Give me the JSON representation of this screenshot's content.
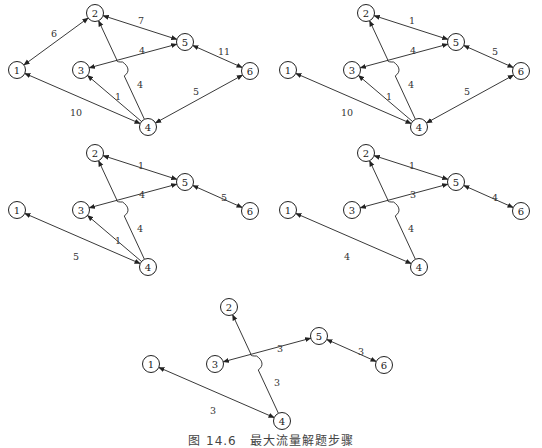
{
  "caption": "图 14.6　最大流量解题步骤",
  "node_layout": {
    "1": [
      17,
      70
    ],
    "2": [
      95,
      13
    ],
    "3": [
      81,
      70
    ],
    "4": [
      148,
      127
    ],
    "5": [
      185,
      42
    ],
    "6": [
      250,
      71
    ]
  },
  "panels": [
    {
      "id": "step-1",
      "offset": [
        0,
        0
      ],
      "nodes": [
        "1",
        "2",
        "3",
        "4",
        "5",
        "6"
      ],
      "edges": [
        {
          "from": "1",
          "to": "2",
          "weight": "6",
          "label_pos": [
            54,
            33
          ],
          "arrows": "both"
        },
        {
          "from": "2",
          "to": "5",
          "weight": "7",
          "label_pos": [
            141,
            20
          ],
          "arrows": "both"
        },
        {
          "from": "3",
          "to": "5",
          "weight": "4",
          "label_pos": [
            142,
            50
          ],
          "arrows": "both"
        },
        {
          "from": "5",
          "to": "6",
          "weight": "11",
          "label_pos": [
            224,
            51
          ],
          "arrows": "both"
        },
        {
          "from": "1",
          "to": "4",
          "weight": "10",
          "label_pos": [
            76,
            112
          ],
          "arrows": "both"
        },
        {
          "from": "4",
          "to": "3",
          "weight": "1",
          "label_pos": [
            118,
            96
          ],
          "arrows": "to"
        },
        {
          "from": "4",
          "to": "2",
          "weight": "4",
          "label_pos": [
            140,
            84
          ],
          "arrows": "to",
          "curved": true
        },
        {
          "from": "4",
          "to": "6",
          "weight": "5",
          "label_pos": [
            196,
            91
          ],
          "arrows": "both"
        }
      ]
    },
    {
      "id": "step-2",
      "offset": [
        271,
        0
      ],
      "nodes": [
        "1",
        "2",
        "3",
        "4",
        "5",
        "6"
      ],
      "edges": [
        {
          "from": "2",
          "to": "5",
          "weight": "1",
          "label_pos": [
            141,
            20
          ],
          "arrows": "both"
        },
        {
          "from": "3",
          "to": "5",
          "weight": "4",
          "label_pos": [
            142,
            50
          ],
          "arrows": "both"
        },
        {
          "from": "5",
          "to": "6",
          "weight": "5",
          "label_pos": [
            224,
            51
          ],
          "arrows": "both"
        },
        {
          "from": "1",
          "to": "4",
          "weight": "10",
          "label_pos": [
            76,
            112
          ],
          "arrows": "both"
        },
        {
          "from": "4",
          "to": "3",
          "weight": "1",
          "label_pos": [
            118,
            96
          ],
          "arrows": "to"
        },
        {
          "from": "4",
          "to": "2",
          "weight": "4",
          "label_pos": [
            140,
            84
          ],
          "arrows": "to",
          "curved": true
        },
        {
          "from": "4",
          "to": "6",
          "weight": "5",
          "label_pos": [
            196,
            91
          ],
          "arrows": "both"
        }
      ]
    },
    {
      "id": "step-3",
      "offset": [
        0,
        140
      ],
      "nodes": [
        "1",
        "2",
        "3",
        "4",
        "5",
        "6"
      ],
      "edges": [
        {
          "from": "2",
          "to": "5",
          "weight": "1",
          "label_pos": [
            141,
            25
          ],
          "arrows": "both"
        },
        {
          "from": "3",
          "to": "5",
          "weight": "4",
          "label_pos": [
            142,
            54
          ],
          "arrows": "both"
        },
        {
          "from": "5",
          "to": "6",
          "weight": "5",
          "label_pos": [
            224,
            57
          ],
          "arrows": "both"
        },
        {
          "from": "1",
          "to": "4",
          "weight": "5",
          "label_pos": [
            76,
            116
          ],
          "arrows": "both"
        },
        {
          "from": "4",
          "to": "3",
          "weight": "1",
          "label_pos": [
            118,
            100
          ],
          "arrows": "to"
        },
        {
          "from": "4",
          "to": "2",
          "weight": "4",
          "label_pos": [
            140,
            88
          ],
          "arrows": "to",
          "curved": true
        }
      ]
    },
    {
      "id": "step-4",
      "offset": [
        271,
        140
      ],
      "nodes": [
        "1",
        "2",
        "3",
        "4",
        "5",
        "6"
      ],
      "edges": [
        {
          "from": "2",
          "to": "5",
          "weight": "1",
          "label_pos": [
            141,
            25
          ],
          "arrows": "both"
        },
        {
          "from": "3",
          "to": "5",
          "weight": "3",
          "label_pos": [
            142,
            54
          ],
          "arrows": "both"
        },
        {
          "from": "5",
          "to": "6",
          "weight": "4",
          "label_pos": [
            224,
            57
          ],
          "arrows": "both"
        },
        {
          "from": "1",
          "to": "4",
          "weight": "4",
          "label_pos": [
            76,
            116
          ],
          "arrows": "both"
        },
        {
          "from": "4",
          "to": "2",
          "weight": "4",
          "label_pos": [
            140,
            88
          ],
          "arrows": "to",
          "curved": true
        }
      ]
    },
    {
      "id": "step-5",
      "offset": [
        134,
        294
      ],
      "nodes": [
        "1",
        "2",
        "3",
        "4",
        "5",
        "6"
      ],
      "edges": [
        {
          "from": "3",
          "to": "5",
          "weight": "3",
          "label_pos": [
            146,
            54
          ],
          "arrows": "both"
        },
        {
          "from": "5",
          "to": "6",
          "weight": "3",
          "label_pos": [
            227,
            57
          ],
          "arrows": "both"
        },
        {
          "from": "1",
          "to": "4",
          "weight": "3",
          "label_pos": [
            79,
            116
          ],
          "arrows": "both"
        },
        {
          "from": "4",
          "to": "2",
          "weight": "3",
          "label_pos": [
            143,
            88
          ],
          "arrows": "to",
          "curved": true
        }
      ]
    }
  ]
}
